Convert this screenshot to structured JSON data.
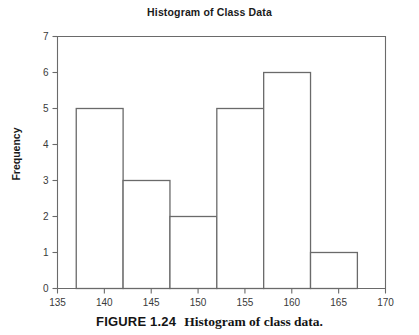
{
  "figure": {
    "caption_number": "FIGURE 1.24",
    "caption_text": "Histogram of class data."
  },
  "chart_data": {
    "type": "bar",
    "title": "Histogram of Class Data",
    "xlabel": "",
    "ylabel": "Frequency",
    "xlim": [
      135,
      170
    ],
    "ylim": [
      0,
      7
    ],
    "grid": false,
    "legend": "none",
    "bin_width": 5,
    "bin_edges": [
      137,
      142,
      147,
      152,
      157,
      162,
      167
    ],
    "categories": [
      "137-142",
      "142-147",
      "147-152",
      "152-157",
      "157-162",
      "162-167"
    ],
    "values": [
      5,
      3,
      2,
      5,
      6,
      1
    ],
    "bars": [
      {
        "start": 137,
        "end": 142,
        "value": 5
      },
      {
        "start": 142,
        "end": 147,
        "value": 3
      },
      {
        "start": 147,
        "end": 152,
        "value": 2
      },
      {
        "start": 152,
        "end": 157,
        "value": 5
      },
      {
        "start": 157,
        "end": 162,
        "value": 6
      },
      {
        "start": 162,
        "end": 167,
        "value": 1
      }
    ],
    "xticks": [
      135,
      140,
      145,
      150,
      155,
      160,
      165,
      170
    ],
    "xtick_labels": [
      "135",
      "140",
      "145",
      "150",
      "155",
      "160",
      "165",
      "170"
    ],
    "yticks": [
      0,
      1,
      2,
      3,
      4,
      5,
      6,
      7
    ],
    "ytick_labels": [
      "0",
      "1",
      "2",
      "3",
      "4",
      "5",
      "6",
      "7"
    ],
    "colors": {
      "bar_stroke": "#6a6a6a",
      "bar_fill": "#ffffff",
      "axis": "#6a6a6a",
      "text": "#231f20",
      "background": "#ffffff"
    }
  }
}
